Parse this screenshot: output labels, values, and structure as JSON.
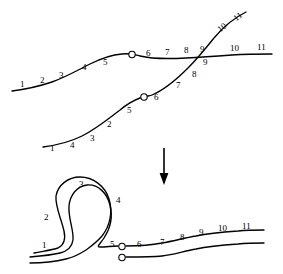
{
  "figure": {
    "background_color": "#ffffff",
    "stroke_color": "#000000",
    "width": 283,
    "height": 274
  },
  "arrow": {
    "name": "downward-transformation-arrow",
    "direction": "down",
    "x": 164,
    "y_start": 148,
    "y_end": 184
  },
  "top_panel": {
    "name": "before-state",
    "curve_a": {
      "name": "upper-strand",
      "labels": [
        "1",
        "2",
        "3",
        "4",
        "5",
        "6",
        "7",
        "8",
        "9",
        "10",
        "11"
      ],
      "marker_between": [
        "5",
        "6"
      ]
    },
    "curve_b": {
      "name": "lower-strand",
      "labels": [
        "1",
        "4",
        "3",
        "2",
        "5",
        "6",
        "7",
        "8",
        "9",
        "10",
        "11"
      ],
      "marker_between": [
        "5",
        "6"
      ]
    },
    "label_positions": [
      {
        "text": "1",
        "x": 20,
        "y": 80,
        "rot": 0,
        "strand": "a"
      },
      {
        "text": "2",
        "x": 40,
        "y": 76,
        "rot": 0,
        "strand": "a"
      },
      {
        "text": "3",
        "x": 59,
        "y": 71,
        "rot": 0,
        "strand": "a"
      },
      {
        "text": "4",
        "x": 82,
        "y": 63,
        "rot": 0,
        "strand": "a"
      },
      {
        "text": "5",
        "x": 103,
        "y": 58,
        "rot": 0,
        "strand": "a"
      },
      {
        "text": "6",
        "x": 146,
        "y": 49,
        "rot": 0,
        "strand": "a"
      },
      {
        "text": "7",
        "x": 165,
        "y": 48,
        "rot": 0,
        "strand": "a"
      },
      {
        "text": "8",
        "x": 184,
        "y": 46,
        "rot": 0,
        "strand": "a"
      },
      {
        "text": "9",
        "x": 200,
        "y": 45,
        "rot": 0,
        "strand": "a"
      },
      {
        "text": "10",
        "x": 230,
        "y": 44,
        "rot": 0,
        "strand": "a"
      },
      {
        "text": "11",
        "x": 257,
        "y": 43,
        "rot": 0,
        "strand": "a"
      },
      {
        "text": "1",
        "x": 50,
        "y": 144,
        "rot": 0,
        "strand": "b"
      },
      {
        "text": "4",
        "x": 70,
        "y": 141,
        "rot": 0,
        "strand": "b"
      },
      {
        "text": "3",
        "x": 90,
        "y": 134,
        "rot": 0,
        "strand": "b"
      },
      {
        "text": "2",
        "x": 107,
        "y": 120,
        "rot": 0,
        "strand": "b"
      },
      {
        "text": "5",
        "x": 127,
        "y": 106,
        "rot": 0,
        "strand": "b"
      },
      {
        "text": "6",
        "x": 154,
        "y": 93,
        "rot": 0,
        "strand": "b"
      },
      {
        "text": "7",
        "x": 176,
        "y": 81,
        "rot": 0,
        "strand": "b"
      },
      {
        "text": "8",
        "x": 192,
        "y": 70,
        "rot": 0,
        "strand": "b"
      },
      {
        "text": "9",
        "x": 203,
        "y": 58,
        "rot": 0,
        "strand": "b"
      },
      {
        "text": "10",
        "x": 216,
        "y": 27,
        "rot": -38,
        "strand": "b"
      },
      {
        "text": "11",
        "x": 232,
        "y": 16,
        "rot": -38,
        "strand": "b"
      }
    ]
  },
  "bottom_panel": {
    "name": "after-state",
    "description": "Looped strand configuration after crossing resolution",
    "labels": [
      "1",
      "2",
      "3",
      "4",
      "5",
      "6",
      "7",
      "8",
      "9",
      "10",
      "11"
    ],
    "marker_count": 2,
    "label_positions": [
      {
        "text": "1",
        "x": 42,
        "y": 241
      },
      {
        "text": "2",
        "x": 44,
        "y": 213
      },
      {
        "text": "3",
        "x": 79,
        "y": 180
      },
      {
        "text": "4",
        "x": 116,
        "y": 196
      },
      {
        "text": "5",
        "x": 110,
        "y": 240
      },
      {
        "text": "6",
        "x": 137,
        "y": 240
      },
      {
        "text": "7",
        "x": 160,
        "y": 238
      },
      {
        "text": "8",
        "x": 180,
        "y": 233
      },
      {
        "text": "9",
        "x": 199,
        "y": 228
      },
      {
        "text": "10",
        "x": 218,
        "y": 224
      },
      {
        "text": "11",
        "x": 242,
        "y": 222
      }
    ]
  }
}
